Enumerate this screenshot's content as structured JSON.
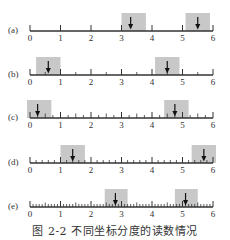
{
  "figure": {
    "caption": "图 2-2   不同坐标分度的读数情况",
    "colors": {
      "line": "#333333",
      "box": "#c8c8c8",
      "text": "#333333",
      "background": "#ffffff"
    },
    "axis": {
      "min": 0,
      "max": 6,
      "major_labels": [
        "0",
        "1",
        "2",
        "3",
        "4",
        "5",
        "6"
      ]
    },
    "rows": [
      {
        "label": "(a)",
        "minor_step": 1,
        "readings": [
          {
            "value": 3.3,
            "box": [
              3.0,
              3.8
            ]
          },
          {
            "value": 5.5,
            "box": [
              5.1,
              5.9
            ]
          }
        ]
      },
      {
        "label": "(b)",
        "minor_step": 0.5,
        "readings": [
          {
            "value": 0.6,
            "box": [
              0.2,
              1.0
            ]
          },
          {
            "value": 4.5,
            "box": [
              4.1,
              4.9
            ]
          }
        ]
      },
      {
        "label": "(c)",
        "minor_step": 0.25,
        "readings": [
          {
            "value": 0.25,
            "box": [
              -0.1,
              0.7
            ]
          },
          {
            "value": 4.75,
            "box": [
              4.4,
              5.2
            ]
          }
        ]
      },
      {
        "label": "(d)",
        "minor_step": 0.2,
        "readings": [
          {
            "value": 1.4,
            "box": [
              1.0,
              1.8
            ]
          },
          {
            "value": 5.7,
            "box": [
              5.3,
              6.1
            ]
          }
        ]
      },
      {
        "label": "(e)",
        "minor_step": 0.1,
        "readings": [
          {
            "value": 2.8,
            "box": [
              2.45,
              3.2
            ]
          },
          {
            "value": 5.1,
            "box": [
              4.75,
              5.5
            ]
          }
        ]
      }
    ]
  }
}
